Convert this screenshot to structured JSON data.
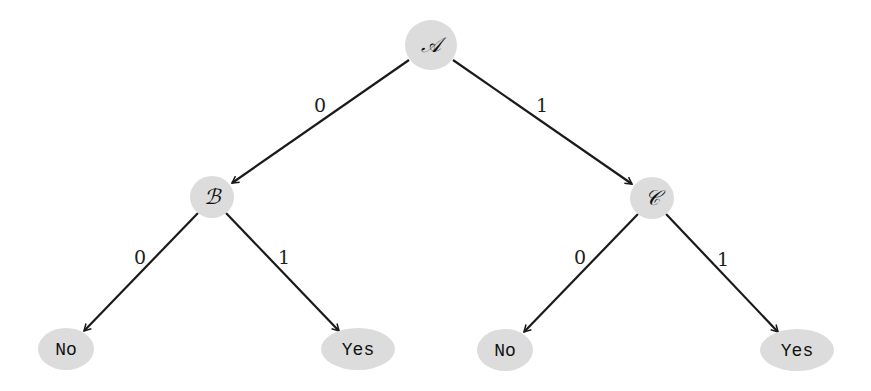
{
  "diagram": {
    "type": "binary-decision-tree",
    "nodes": [
      {
        "id": "A",
        "label": "𝒜",
        "kind": "decision",
        "cx": 431,
        "cy": 45,
        "rx": 26,
        "ry": 25
      },
      {
        "id": "B",
        "label": "ℬ",
        "kind": "decision",
        "cx": 212,
        "cy": 197,
        "rx": 22,
        "ry": 21
      },
      {
        "id": "C",
        "label": "𝒞",
        "kind": "decision",
        "cx": 652,
        "cy": 198,
        "rx": 22,
        "ry": 21
      },
      {
        "id": "B0",
        "label": "No",
        "kind": "leaf",
        "cx": 66,
        "cy": 349,
        "rx": 28,
        "ry": 21
      },
      {
        "id": "B1",
        "label": "Yes",
        "kind": "leaf",
        "cx": 358,
        "cy": 349,
        "rx": 37,
        "ry": 21
      },
      {
        "id": "C0",
        "label": "No",
        "kind": "leaf",
        "cx": 505,
        "cy": 350,
        "rx": 28,
        "ry": 21
      },
      {
        "id": "C1",
        "label": "Yes",
        "kind": "leaf",
        "cx": 797,
        "cy": 350,
        "rx": 37,
        "ry": 21
      }
    ],
    "edges": [
      {
        "from": "A",
        "to": "B",
        "label": "0",
        "x1": 409,
        "y1": 60,
        "x2": 232,
        "y2": 183,
        "lx": 320,
        "ly": 112
      },
      {
        "from": "A",
        "to": "C",
        "label": "1",
        "x1": 453,
        "y1": 60,
        "x2": 632,
        "y2": 184,
        "lx": 542,
        "ly": 112
      },
      {
        "from": "B",
        "to": "B0",
        "label": "0",
        "x1": 198,
        "y1": 213,
        "x2": 84,
        "y2": 331,
        "lx": 140,
        "ly": 264
      },
      {
        "from": "B",
        "to": "B1",
        "label": "1",
        "x1": 226,
        "y1": 213,
        "x2": 339,
        "y2": 331,
        "lx": 284,
        "ly": 264
      },
      {
        "from": "C",
        "to": "C0",
        "label": "0",
        "x1": 638,
        "y1": 214,
        "x2": 524,
        "y2": 332,
        "lx": 580,
        "ly": 264
      },
      {
        "from": "C",
        "to": "C1",
        "label": "1",
        "x1": 666,
        "y1": 214,
        "x2": 778,
        "y2": 332,
        "lx": 723,
        "ly": 266
      }
    ],
    "colors": {
      "node_fill": "#dcdcdc",
      "edge_stroke": "#1a1a1a",
      "text": "#111111",
      "background": "#ffffff"
    }
  }
}
